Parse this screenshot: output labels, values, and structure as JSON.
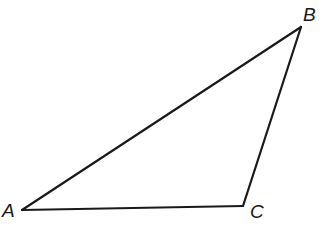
{
  "diagram": {
    "type": "triangle",
    "stroke_color": "#1a1a1a",
    "stroke_width": 2.2,
    "background": "#ffffff",
    "vertices": [
      {
        "name": "A",
        "x": 22,
        "y": 210,
        "label_x": 2,
        "label_y": 217
      },
      {
        "name": "B",
        "x": 301,
        "y": 27,
        "label_x": 303,
        "label_y": 21
      },
      {
        "name": "C",
        "x": 243,
        "y": 206,
        "label_x": 250,
        "label_y": 218
      }
    ],
    "edges": [
      {
        "name": "AB",
        "from": "A",
        "to": "B"
      },
      {
        "name": "BC",
        "from": "B",
        "to": "C"
      },
      {
        "name": "CA",
        "from": "C",
        "to": "A"
      }
    ],
    "labels": {
      "A": "A",
      "B": "B",
      "C": "C"
    }
  }
}
